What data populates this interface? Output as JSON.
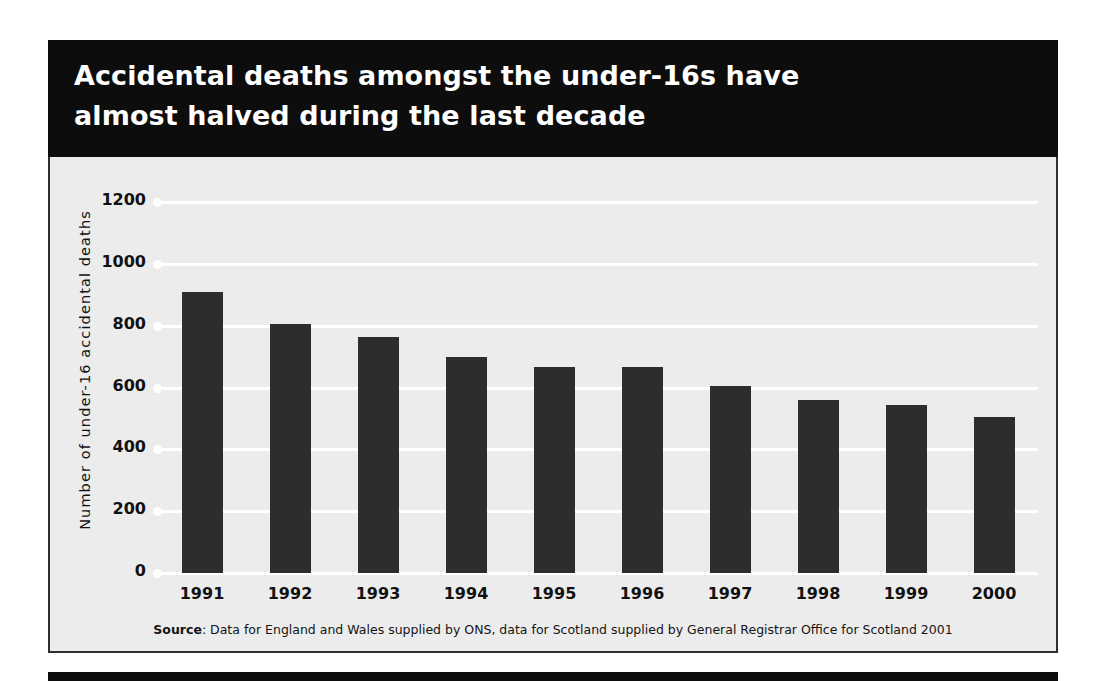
{
  "title": {
    "line1": "Accidental deaths amongst the under-16s have",
    "line2": "almost halved during the last decade"
  },
  "source": {
    "label": "Source",
    "text": ": Data for England and Wales supplied by ONS, data for Scotland supplied by General Registrar Office for Scotland 2001"
  },
  "colors": {
    "band": "#0d0d0d",
    "panel_background": "#ececec",
    "bar": "#2d2d2d",
    "gridline": "#ffffff",
    "text": "#111111"
  },
  "chart_data": {
    "type": "bar",
    "title": "Accidental deaths amongst the under-16s have almost halved during the last decade",
    "xlabel": "",
    "ylabel": "Number of under-16 accidental deaths",
    "ylim": [
      0,
      1200
    ],
    "ytick_step": 200,
    "yticks": [
      1200,
      1000,
      800,
      600,
      400,
      200,
      0
    ],
    "ytick_labels": [
      "1200",
      "1000",
      "800",
      "600",
      "400",
      "200",
      "0"
    ],
    "categories": [
      "1991",
      "1992",
      "1993",
      "1994",
      "1995",
      "1996",
      "1997",
      "1998",
      "1999",
      "2000"
    ],
    "values": [
      910,
      805,
      765,
      700,
      665,
      665,
      605,
      560,
      545,
      505
    ],
    "grid": true,
    "legend": false,
    "bar_color": "#2d2d2d"
  }
}
